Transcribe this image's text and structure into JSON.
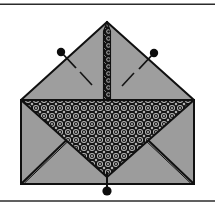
{
  "figure": {
    "domain_note": "line-art craft diagram",
    "colors": {
      "background": "#ffffff",
      "paper_gray": "#9a9a9a",
      "flap_gray": "#9e9e9e",
      "pattern_dark": "#161616",
      "pattern_light": "#b4b4b4",
      "outline": "#101010",
      "rule": "#2b2b2b"
    },
    "rules": [
      {
        "name": "top-rule",
        "y": 4,
        "x1": 0,
        "x2": 215,
        "width": 1.4
      },
      {
        "name": "bottom-rule",
        "y": 201,
        "x1": 0,
        "x2": 215,
        "width": 1.4
      }
    ],
    "envelope": {
      "body": {
        "left": 21,
        "top": 100,
        "right": 194,
        "bottom": 184
      },
      "apex": {
        "x": 107,
        "y": 22
      },
      "left_flap_corner": {
        "x": 21,
        "y": 100
      },
      "right_flap_corner": {
        "x": 194,
        "y": 100
      },
      "front_triangle_tip": {
        "x": 107,
        "y": 176
      }
    },
    "seam": {
      "name": "center-seam",
      "x": 107,
      "top": 22,
      "bottom": 100,
      "width": 5
    },
    "pins": [
      {
        "name": "pin-left",
        "head_x": 61,
        "head_y": 52,
        "tail_x": 75,
        "tail_y": 67,
        "radius": 4.2
      },
      {
        "name": "pin-right",
        "head_x": 154,
        "head_y": 53,
        "tail_x": 140,
        "tail_y": 68,
        "radius": 4.2
      },
      {
        "name": "pin-bottom",
        "head_x": 107,
        "head_y": 191,
        "tail_x": 107,
        "tail_y": 174,
        "radius": 4.6
      }
    ],
    "stitch_marks": [
      {
        "name": "stitch-mark-left",
        "x1": 80,
        "y1": 72,
        "x2": 92,
        "y2": 85
      },
      {
        "name": "stitch-mark-right",
        "x1": 134,
        "y1": 73,
        "x2": 122,
        "y2": 86
      }
    ],
    "fold_lines": [
      {
        "name": "fold-line-bottom-left",
        "x1": 22,
        "y1": 183,
        "x2": 106,
        "y2": 102
      },
      {
        "name": "fold-line-bottom-right",
        "x1": 193,
        "y1": 183,
        "x2": 108,
        "y2": 102
      }
    ],
    "pattern": {
      "name": "rosette-floral-print",
      "cell_size": 8,
      "description": "dense repeating dark rosette motif with light centers"
    }
  }
}
